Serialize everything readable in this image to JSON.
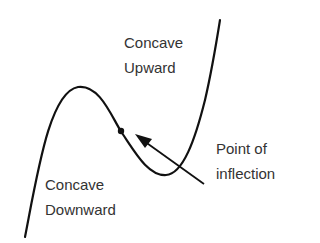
{
  "diagram": {
    "labels": {
      "concave_upward": [
        "Concave",
        "Upward"
      ],
      "concave_downward": [
        "Concave",
        "Downward"
      ],
      "inflection": [
        "Point of",
        "inflection"
      ]
    },
    "colors": {
      "curve": "#111111",
      "text": "#333333",
      "background": "#ffffff"
    }
  }
}
